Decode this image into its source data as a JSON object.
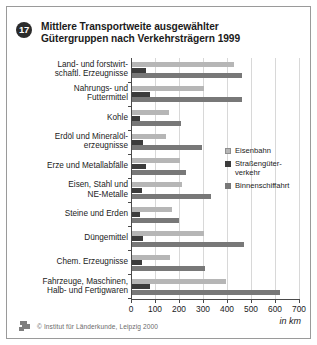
{
  "figure": {
    "number": "17",
    "title_line1": "Mittlere Transportweite ausgewählter",
    "title_line2": "Gütergruppen nach Verkehrsträgern 1999",
    "unit_label": "in km",
    "footer_text": "© Institut für Länderkunde, Leipzig 2000",
    "footer_logo": "institut-logo-icon"
  },
  "colors": {
    "series_eisenbahn": "#b6b6b6",
    "series_strasse": "#3c3c3c",
    "series_binnen": "#787878",
    "axis": "#4a4a4a",
    "grid": "#d8d8d8",
    "frame": "#9a9a9a",
    "text": "#1b1b1b"
  },
  "chart_data": {
    "type": "bar",
    "orientation": "horizontal",
    "title": "Mittlere Transportweite ausgewählter Gütergruppen nach Verkehrsträgern 1999",
    "xlabel": "in km",
    "ylabel": "",
    "xlim": [
      0,
      700
    ],
    "xticks": [
      0,
      100,
      200,
      300,
      400,
      500,
      600,
      700
    ],
    "grid": true,
    "legend_position": "right",
    "categories": [
      "Land- und forstwirtschaftl. Erzeugnisse",
      "Nahrungs- und Futtermittel",
      "Kohle",
      "Erdöl und Mineralölerzeugnisse",
      "Erze und Metallabfälle",
      "Eisen, Stahl und NE-Metalle",
      "Steine und Erden",
      "Düngemittel",
      "Chem. Erzeugnisse",
      "Fahrzeuge, Maschinen, Halb- und Fertigwaren"
    ],
    "category_lines": [
      [
        "Land- und forstwirt-",
        "schaftl. Erzeugnisse"
      ],
      [
        "Nahrungs- und",
        "Futtermittel"
      ],
      [
        "Kohle"
      ],
      [
        "Erdöl und Mineralöl-",
        "erzeugnisse"
      ],
      [
        "Erze und Metallabfälle"
      ],
      [
        "Eisen, Stahl und",
        "NE-Metalle"
      ],
      [
        "Steine und Erden"
      ],
      [
        "Düngemittel"
      ],
      [
        "Chem. Erzeugnisse"
      ],
      [
        "Fahrzeuge, Maschinen,",
        "Halb- und Fertigwaren"
      ]
    ],
    "series": [
      {
        "name": "Eisenbahn",
        "name_lines": [
          "Eisenbahn"
        ],
        "color": "#b6b6b6",
        "values": [
          425,
          300,
          155,
          140,
          200,
          210,
          165,
          300,
          160,
          390
        ]
      },
      {
        "name": "Straßengüterverkehr",
        "name_lines": [
          "Straßengüter-",
          "verkehr"
        ],
        "color": "#3c3c3c",
        "values": [
          60,
          75,
          35,
          45,
          60,
          40,
          35,
          45,
          40,
          75
        ]
      },
      {
        "name": "Binnenschiffahrt",
        "name_lines": [
          "Binnenschiffahrt"
        ],
        "color": "#787878",
        "values": [
          460,
          460,
          205,
          290,
          225,
          330,
          195,
          465,
          305,
          615
        ]
      }
    ]
  }
}
